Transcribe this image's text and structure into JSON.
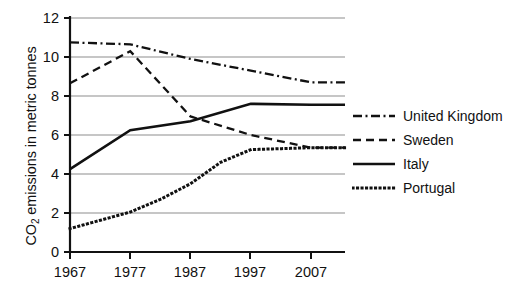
{
  "chart_data": {
    "type": "line",
    "title": "",
    "subtitle": "",
    "xlabel": "",
    "ylabel": "CO2 emissions in metric tonnes",
    "ylabel_parts": {
      "pre": "CO",
      "sub": "2",
      "post": " emissions in metric tonnes"
    },
    "x": [
      1967,
      1977,
      1987,
      1997,
      2007
    ],
    "categories": [
      "1967",
      "1977",
      "1987",
      "1997",
      "2007"
    ],
    "xtick_labels": [
      "1967",
      "1977",
      "1987",
      "1997",
      "2007"
    ],
    "ytick_labels": [
      "0",
      "2",
      "4",
      "6",
      "8",
      "10",
      "12"
    ],
    "yticks": [
      0,
      2,
      4,
      6,
      8,
      10,
      12
    ],
    "xlim": [
      1967,
      2010
    ],
    "ylim": [
      0,
      12
    ],
    "grid": "horizontal",
    "legend_position": "right",
    "series": [
      {
        "name": "United Kingdom",
        "linestyle": "dashdot",
        "color": "#111111",
        "values": [
          10.75,
          10.65,
          9.9,
          9.3,
          8.7
        ]
      },
      {
        "name": "Sweden",
        "linestyle": "dashed",
        "color": "#111111",
        "values": [
          8.65,
          10.3,
          6.95,
          6.0,
          5.35
        ]
      },
      {
        "name": "Italy",
        "linestyle": "solid",
        "color": "#111111",
        "values": [
          4.25,
          6.25,
          6.7,
          7.6,
          7.55
        ]
      },
      {
        "name": "Portugal",
        "linestyle": "dotted",
        "color": "#111111",
        "values": [
          1.2,
          2.05,
          3.5,
          5.25,
          5.35
        ],
        "extra_points": [
          {
            "x": 1982,
            "y": 2.7
          },
          {
            "x": 1992,
            "y": 4.6
          }
        ]
      }
    ]
  },
  "legend": {
    "items": [
      {
        "label": "United Kingdom",
        "style": "dashdot"
      },
      {
        "label": "Sweden",
        "style": "dashed"
      },
      {
        "label": "Italy",
        "style": "solid"
      },
      {
        "label": "Portugal",
        "style": "dotted"
      }
    ]
  },
  "axes": {
    "y_title": "CO2 emissions in metric tonnes",
    "axis_color": "#111111",
    "grid_color": "#8d8d8d"
  }
}
